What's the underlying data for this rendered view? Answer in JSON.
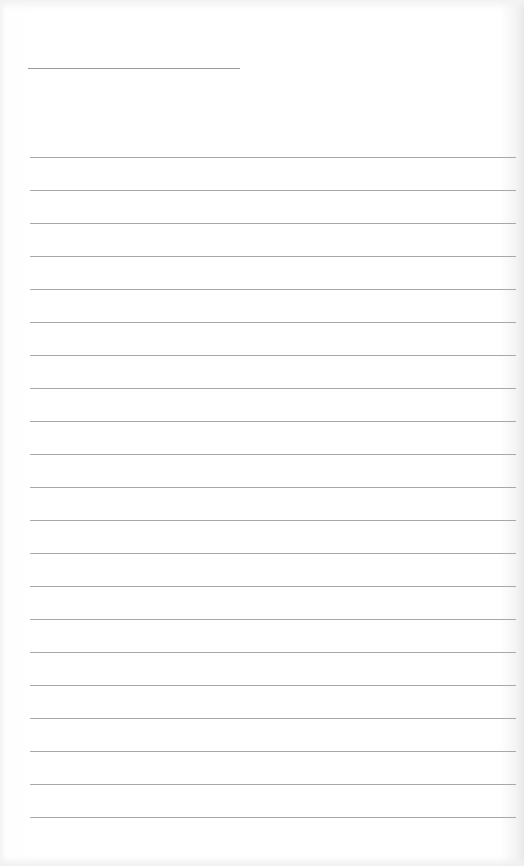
{
  "page": {
    "type": "lined-notepaper",
    "background_color": "#ffffff",
    "line_color": "#a8a8a8",
    "title_line": {
      "x": 28,
      "y": 68,
      "width": 212
    },
    "ruled_lines": {
      "count": 21,
      "first_y": 157,
      "spacing": 33,
      "x": 30,
      "width": 486
    }
  }
}
